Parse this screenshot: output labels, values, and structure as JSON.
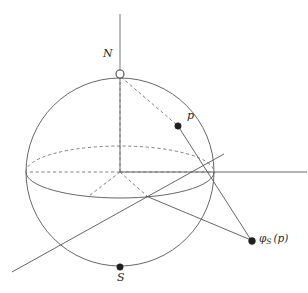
{
  "figure": {
    "background_color": "#ffffff",
    "stroke_color": "#565656",
    "dash_color": "#6b6b6b",
    "label_color": "#2b2b2b",
    "width": 308,
    "height": 293
  },
  "labels": {
    "north_pole": "N",
    "south_pole": "S",
    "point_p": "p",
    "projection_prefix": "φ",
    "projection_subscript": "S",
    "projection_argument": "(p)",
    "projection_full": "φS (p)"
  },
  "geometry": {
    "sphere": {
      "cx": 120,
      "cy": 172,
      "r": 94
    },
    "equator": {
      "cx": 120,
      "cy": 172,
      "rx": 94,
      "ry": 26
    },
    "points": {
      "north_pole": {
        "x": 120,
        "y": 74,
        "marker": "hollow-circle",
        "radius": 4
      },
      "south_pole": {
        "x": 120,
        "y": 267,
        "marker": "filled-dot",
        "radius": 3.2
      },
      "center": {
        "x": 120,
        "y": 172,
        "marker": "none"
      },
      "p": {
        "x": 178,
        "y": 126,
        "marker": "filled-dot",
        "radius": 3.2
      },
      "phi_s_p": {
        "x": 252,
        "y": 241,
        "marker": "filled-dot",
        "radius": 3.4
      }
    },
    "axis_vertical": {
      "x1": 120,
      "y1": 14,
      "x2": 120,
      "y2": 172
    },
    "axis_horizontal": {
      "x1": 120,
      "y1": 172,
      "x2": 307,
      "y2": 172
    },
    "diagonal_line": {
      "x1": 222,
      "y1": 155,
      "x2": 12,
      "y2": 272
    },
    "ray_n_to_p_dashed": {
      "x1": 120,
      "y1": 74,
      "x2": 178,
      "y2": 126
    },
    "ray_p_to_image_solid": {
      "x1": 178,
      "y1": 126,
      "x2": 252,
      "y2": 241
    },
    "ray_equator_to_image": {
      "x1": 146,
      "y1": 196,
      "x2": 252,
      "y2": 241
    },
    "radial_dashed_center_to_north": {
      "x1": 120,
      "y1": 172,
      "x2": 120,
      "y2": 74
    },
    "radial_dashed_center_to_left_equator": {
      "x1": 120,
      "y1": 172,
      "x2": 26,
      "y2": 172
    },
    "radial_dashed_center_to_right_equator": {
      "x1": 120,
      "y1": 172,
      "x2": 214,
      "y2": 172
    },
    "radial_dashed_center_to_front": {
      "x1": 120,
      "y1": 172,
      "x2": 146,
      "y2": 196
    },
    "radial_dashed_center_to_front_left": {
      "x1": 120,
      "y1": 172,
      "x2": 90,
      "y2": 196
    }
  },
  "label_positions": {
    "north_pole": {
      "x": 104,
      "y": 54
    },
    "south_pole": {
      "x": 117,
      "y": 272
    },
    "point_p": {
      "x": 187,
      "y": 113
    },
    "projection": {
      "x": 260,
      "y": 234
    }
  },
  "page_bleed_text": ""
}
